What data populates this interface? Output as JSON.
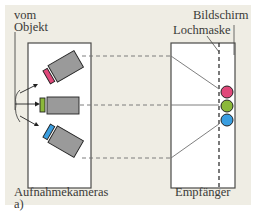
{
  "labels": {
    "object": [
      "vom",
      "Objekt"
    ],
    "screen": "Bildschirm",
    "shadow_mask": "Lochmaske",
    "cameras": "Aufnahmekameras",
    "receiver": "Empfänger",
    "figure_part": "a)"
  },
  "colors": {
    "background": "#efede4",
    "box_fill": "#ffffff",
    "box_stroke": "#4a4a48",
    "camera_body": "#9a9a9a",
    "red": "#e0487a",
    "green": "#8bb83a",
    "blue": "#3a9ee0",
    "dashed_line": "#707070"
  },
  "cameras": [
    {
      "name": "red-camera",
      "filter_color": "red"
    },
    {
      "name": "green-camera",
      "filter_color": "green"
    },
    {
      "name": "blue-camera",
      "filter_color": "blue"
    }
  ],
  "phosphor_dots": [
    {
      "name": "red-dot",
      "color": "red"
    },
    {
      "name": "green-dot",
      "color": "green"
    },
    {
      "name": "blue-dot",
      "color": "blue"
    }
  ]
}
